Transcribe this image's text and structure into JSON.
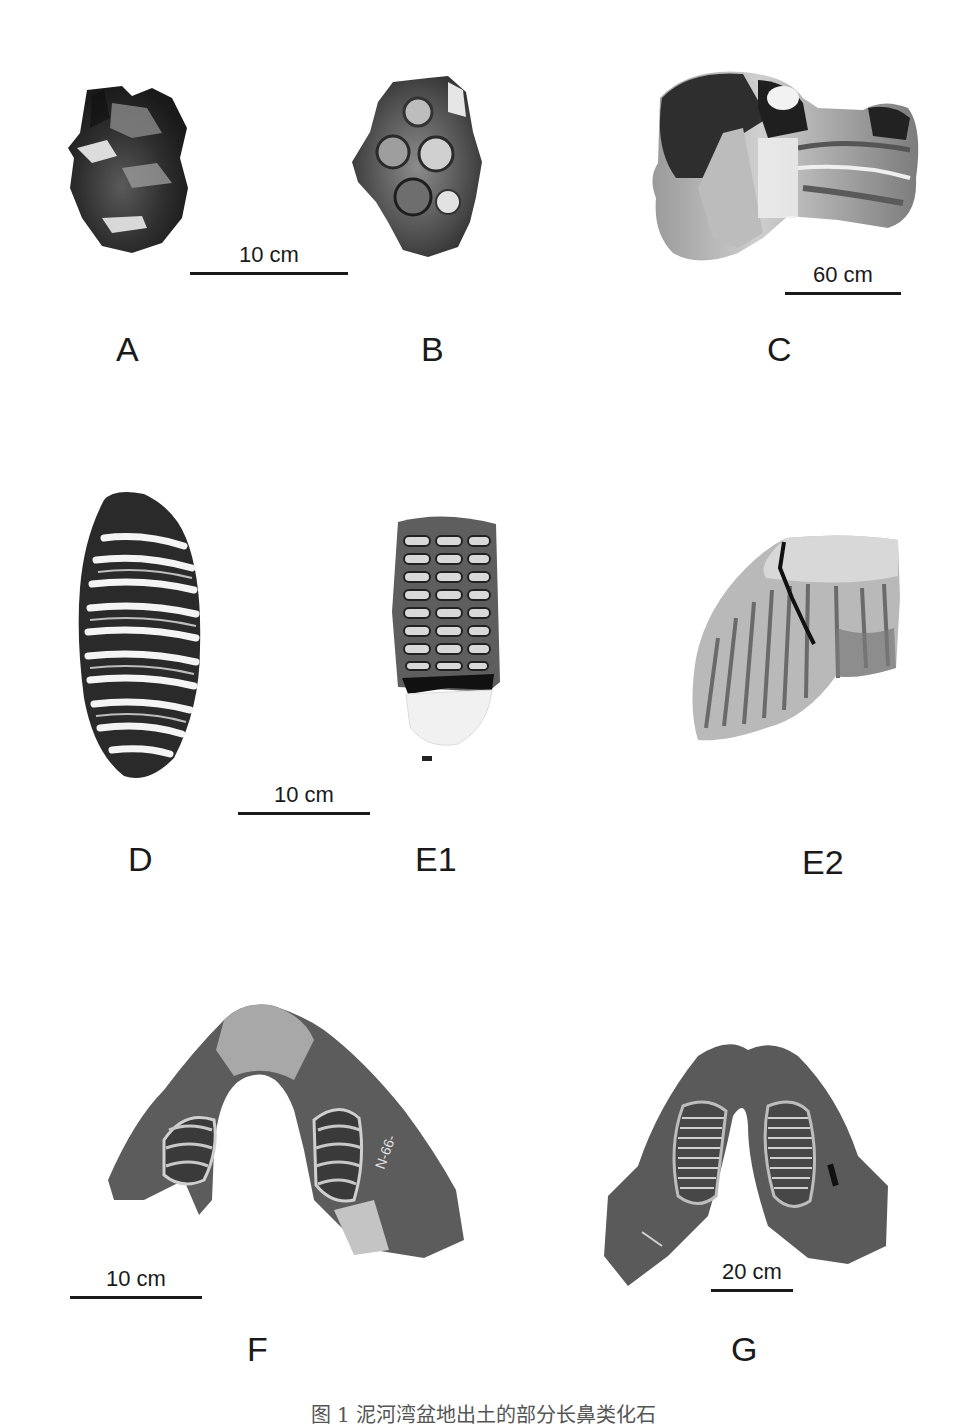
{
  "figure": {
    "caption": "图 1  泥河湾盆地出土的部分长鼻类化石",
    "panels": [
      {
        "id": "A",
        "label": "A",
        "description": "molar fragment, occlusal view (dark, fractured)"
      },
      {
        "id": "B",
        "label": "B",
        "description": "molar, occlusal view with conical cusps"
      },
      {
        "id": "C",
        "label": "C",
        "description": "large long bone (femur/humerus) epiphysis"
      },
      {
        "id": "D",
        "label": "D",
        "description": "elongated molar with many lamellae"
      },
      {
        "id": "E1",
        "label": "E1",
        "description": "molar occlusal view with enamel loops"
      },
      {
        "id": "E2",
        "label": "E2",
        "description": "molar lateral view with oblique plates and crack"
      },
      {
        "id": "F",
        "label": "F",
        "description": "mandible with cheek teeth, specimen number written on bone"
      },
      {
        "id": "G",
        "label": "G",
        "description": "mandible with lamellar molars"
      }
    ],
    "scale_bars": [
      {
        "id": "scale-ab",
        "text": "10 cm",
        "applies_to": [
          "A",
          "B"
        ]
      },
      {
        "id": "scale-c",
        "text": "60 cm",
        "applies_to": [
          "C"
        ]
      },
      {
        "id": "scale-de",
        "text": "10 cm",
        "applies_to": [
          "D",
          "E1",
          "E2"
        ]
      },
      {
        "id": "scale-f",
        "text": "10 cm",
        "applies_to": [
          "F"
        ]
      },
      {
        "id": "scale-g",
        "text": "20 cm",
        "applies_to": [
          "G"
        ]
      }
    ],
    "specimen_marking_F": "N-66-..."
  }
}
